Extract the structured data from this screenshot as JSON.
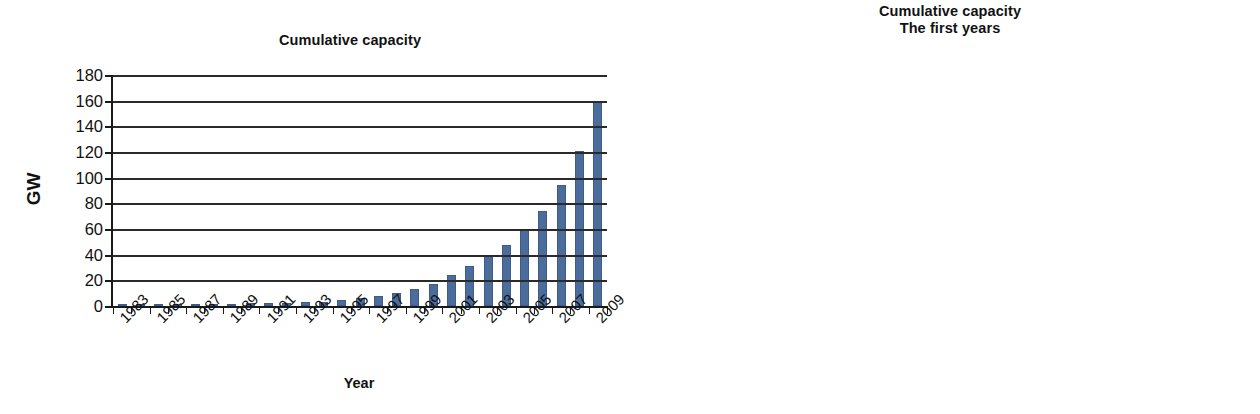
{
  "figure": {
    "left_chart": {
      "title_line1": "Cumulative capacity",
      "title_line2": "",
      "xlabel": "Year",
      "ylabel": "GW"
    },
    "right_chart": {
      "title_line1": "Cumulative capacity",
      "title_line2": "The first years",
      "xlabel": "Year",
      "ylabel": "MW"
    },
    "bar_color": "#4c6d9c",
    "axis_color": "#1a1a1a"
  },
  "chart_data": [
    {
      "type": "bar",
      "title": "Cumulative capacity",
      "xlabel": "Year",
      "ylabel": "GW",
      "ylim": [
        0,
        180
      ],
      "ytick_step": 20,
      "yticks": [
        "0",
        "20",
        "40",
        "60",
        "80",
        "100",
        "120",
        "140",
        "160",
        "180"
      ],
      "grid": true,
      "legend": "none",
      "xtick_label_interval": 2,
      "categories": [
        "1983",
        "1984",
        "1985",
        "1986",
        "1987",
        "1988",
        "1989",
        "1990",
        "1991",
        "1992",
        "1993",
        "1994",
        "1995",
        "1996",
        "1997",
        "1998",
        "1999",
        "2000",
        "2001",
        "2002",
        "2003",
        "2004",
        "2005",
        "2006",
        "2007",
        "2008",
        "2009"
      ],
      "xtick_labels_shown": [
        "1983",
        "1985",
        "1987",
        "1989",
        "1991",
        "1993",
        "1995",
        "1997",
        "1999",
        "2001",
        "2003",
        "2005",
        "2007",
        "2009"
      ],
      "values": [
        0.2,
        0.6,
        1.0,
        1.3,
        1.5,
        1.7,
        1.8,
        2.0,
        2.3,
        2.5,
        3.0,
        3.5,
        4.8,
        6.1,
        7.6,
        10.2,
        13.6,
        17.4,
        23.9,
        31.1,
        39.4,
        47.6,
        59.1,
        74.0,
        94.0,
        121.0,
        159.0
      ],
      "annotations": []
    },
    {
      "type": "bar",
      "title": "Cumulative capacity\nThe first years",
      "title_line1": "Cumulative capacity",
      "title_line2": "The first years",
      "xlabel": "Year",
      "ylabel": "MW",
      "ylim": [
        0,
        6000
      ],
      "ytick_step": 1000,
      "yticks": [
        "0",
        "1000",
        "2000",
        "3000",
        "4000",
        "5000",
        "6000"
      ],
      "grid": true,
      "legend": "none",
      "xtick_label_interval": 1,
      "categories": [
        "1983",
        "1984",
        "1985",
        "1986",
        "1987",
        "1988",
        "1989",
        "1990",
        "1991",
        "1992",
        "1993",
        "1994",
        "1995"
      ],
      "xtick_labels_shown": [
        "1983",
        "1984",
        "1985",
        "1986",
        "1987",
        "1988",
        "1989",
        "1990",
        "1991",
        "1992",
        "1993",
        "1994",
        "1995"
      ],
      "values": [
        210,
        600,
        1020,
        1330,
        1520,
        1650,
        1800,
        2040,
        2250,
        2510,
        2970,
        3530,
        4800
      ],
      "annotations": []
    }
  ]
}
